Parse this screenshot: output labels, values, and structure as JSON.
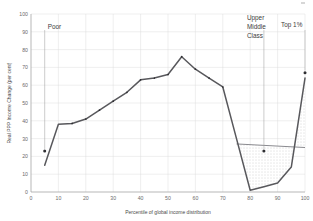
{
  "chart_data": {
    "type": "line",
    "title": "",
    "subtitle": "",
    "xlabel": "Percentile of global income distribution",
    "ylabel": "Real PPP Income Change (per cent)",
    "xlim": [
      0,
      100
    ],
    "ylim": [
      0,
      100
    ],
    "xticks": [
      0,
      10,
      20,
      30,
      40,
      50,
      60,
      70,
      80,
      90,
      100
    ],
    "yticks": [
      0,
      10,
      20,
      30,
      40,
      50,
      60,
      70,
      80,
      90,
      100
    ],
    "xtick_labels": [
      "0",
      "10",
      "20",
      "30",
      "40",
      "50",
      "60",
      "70",
      "80",
      "90",
      "100"
    ],
    "ytick_labels": [
      "0",
      "10",
      "20",
      "30",
      "40",
      "50",
      "60",
      "70",
      "80",
      "90",
      "100"
    ],
    "grid": true,
    "legend": "none",
    "series": [
      {
        "name": "Real PPP income change",
        "color": "#58585c",
        "x": [
          5,
          10,
          15,
          20,
          25,
          30,
          35,
          40,
          45,
          50,
          55,
          60,
          65,
          70,
          75,
          80,
          85,
          90,
          95,
          100
        ],
        "values": [
          15,
          38,
          38.5,
          41,
          46,
          51,
          56,
          63,
          64,
          66,
          76,
          69,
          64,
          59,
          30,
          1,
          3,
          5,
          14,
          64
        ]
      },
      {
        "name": "Shaded region upper edge",
        "color": "#7d7d82",
        "x": [
          75,
          100
        ],
        "values": [
          27,
          25
        ]
      }
    ],
    "shaded_region": {
      "style": "dotted-fill",
      "x_start": 75,
      "x_end": 100,
      "upper_values": [
        27,
        25
      ],
      "note": "dotted area between upper edge line and the dipping curve"
    },
    "annotations": [
      {
        "label": "Poor",
        "point_x": 5,
        "point_y": 23,
        "leader_from_y": 91,
        "marker": true
      },
      {
        "label": "Upper Middle Class",
        "label_lines": [
          "Upper",
          "Middle",
          "Class"
        ],
        "point_x": 85,
        "point_y": 23,
        "leader_from_y": 91,
        "marker": true
      },
      {
        "label": "Top 1%",
        "point_x": 100,
        "point_y": 67,
        "leader_from_y": 91,
        "marker": true
      }
    ]
  },
  "axes": {
    "y_title": "Real PPP Income Change (per cent)",
    "x_title": "Percentile of global income distribution",
    "y_ticks": [
      "100",
      "90",
      "80",
      "70",
      "60",
      "50",
      "40",
      "30",
      "20",
      "10",
      "0"
    ],
    "x_ticks": [
      "0",
      "10",
      "20",
      "30",
      "40",
      "50",
      "60",
      "70",
      "80",
      "90",
      "100"
    ]
  },
  "annotation_text": {
    "poor": "Poor",
    "upper_middle_1": "Upper",
    "upper_middle_2": "Middle",
    "upper_middle_3": "Class",
    "top1": "Top 1%"
  },
  "colors": {
    "series": "#58585c",
    "grid": "#dcdcdc",
    "axis": "#9a9a9a",
    "text": "#4a4a4a",
    "shade": "#9c9ca0",
    "background": "#ffffff"
  }
}
